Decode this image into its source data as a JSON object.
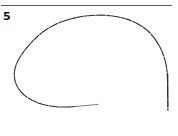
{
  "page": {
    "width": 178,
    "height": 136,
    "background_color": "#ffffff"
  },
  "rule": {
    "name": "horizontal-rule",
    "color": "#5a5a5a",
    "thickness": 1,
    "x": 1,
    "y": 5,
    "length": 171
  },
  "figure": {
    "number_label": "5",
    "number_color": "#111111"
  },
  "chart_data": {
    "type": "line",
    "title": "5",
    "subtitle": "",
    "xlabel": "",
    "ylabel": "",
    "grid": false,
    "legend": null,
    "xlim": [
      0,
      178
    ],
    "ylim": [
      136,
      0
    ],
    "annotations": [],
    "series": [
      {
        "name": "outline-curve",
        "stroke_color": "#2b2b2b",
        "stroke_width": 1.1,
        "closed": false,
        "path": "M 167.5 78 C 167.2 62 162 46 150 33 C 136 18.5 114 14.6 96 15.2 C 74 15.9 52 23 38 36 C 24 49 12.5 64 14.5 78 C 16.2 90 26 99 40 103.5 C 52 107.4 64 107.6 76 106.4",
        "points": [
          [
            167.5,
            78
          ],
          [
            164.0,
            62.0
          ],
          [
            157.0,
            46.0
          ],
          [
            146.0,
            33.0
          ],
          [
            131.0,
            22.0
          ],
          [
            113.0,
            16.5
          ],
          [
            96.0,
            15.2
          ],
          [
            79.0,
            17.0
          ],
          [
            62.0,
            21.5
          ],
          [
            48.0,
            28.5
          ],
          [
            34.0,
            39.0
          ],
          [
            22.0,
            53.0
          ],
          [
            14.5,
            68.0
          ],
          [
            15.5,
            82.0
          ],
          [
            23.0,
            93.0
          ],
          [
            36.0,
            101.0
          ],
          [
            52.0,
            106.0
          ],
          [
            66.0,
            107.2
          ],
          [
            76.0,
            106.4
          ]
        ]
      },
      {
        "name": "right-vertical-tail",
        "stroke_color": "#2b2b2b",
        "stroke_width": 1.4,
        "closed": false,
        "path": "M 167.6 74 L 167.9 110",
        "points": [
          [
            167.6,
            74
          ],
          [
            167.9,
            110
          ]
        ]
      },
      {
        "name": "bottom-fading-tail",
        "stroke_color": "#6f6f6f",
        "stroke_width": 0.9,
        "closed": false,
        "path": "M 74 106.6 C 82 106.0 90 105.2 98 104.4",
        "points": [
          [
            74,
            106.6
          ],
          [
            86,
            105.6
          ],
          [
            98,
            104.4
          ]
        ]
      }
    ]
  }
}
